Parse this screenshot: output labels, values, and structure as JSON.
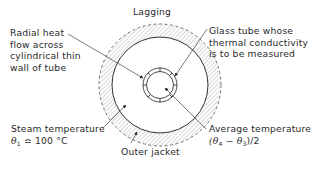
{
  "diagram": {
    "labels": {
      "lagging": "Lagging",
      "radial_heat_flow": [
        "Radial heat",
        "flow across",
        "cylindrical thin",
        "wall of tube"
      ],
      "glass_tube": [
        "Glass tube whose",
        "thermal conductivity",
        "is to be measured"
      ],
      "steam_temperature": "Steam temperature",
      "steam_value_symbol": "θ",
      "steam_value_sub": "1",
      "steam_value_rest": " ≏ 100 °C",
      "average_temperature": "Average temperature",
      "avg_open": "(θ",
      "avg_sub4": "4",
      "avg_mid": " − θ",
      "avg_sub3": "3",
      "avg_close": ")/2",
      "outer_jacket": "Outer jacket"
    },
    "components": [
      {
        "name": "lagging",
        "shape": "hatched annulus",
        "outer_border": "dashed"
      },
      {
        "name": "outer jacket",
        "shape": "circle"
      },
      {
        "name": "steam space",
        "shape": "annular region"
      },
      {
        "name": "glass tube",
        "shape": "thin annulus with thermocouple marks"
      }
    ],
    "colors": {
      "line": "#333333",
      "hatch": "#9a9a9a",
      "background": "#ffffff"
    }
  }
}
